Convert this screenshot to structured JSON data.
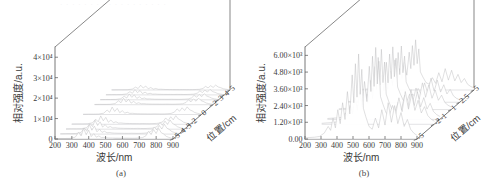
{
  "figure": {
    "width": 485,
    "height": 194,
    "background": "#ffffff",
    "line_color": "#555555",
    "trace_color": "#b9b9bd",
    "top_clipped_text": "· · · · · · · · · · · · · · · · · ·"
  },
  "panels": [
    {
      "id": "a",
      "caption": "(a)",
      "xlabel": "波长/nm",
      "ylabel": "相对强度/a.u.",
      "zlabel": "位置/cm",
      "xticks": [
        "200",
        "300",
        "400",
        "500",
        "600",
        "700",
        "800",
        "900"
      ],
      "yticks": [
        "0",
        "1×10⁴",
        "2×10⁴",
        "3×10⁴",
        "4×10⁴"
      ],
      "zticks": [
        "-5",
        "-4",
        "-3",
        "-2",
        "0",
        "2",
        "3",
        "4",
        "5"
      ]
    },
    {
      "id": "b",
      "caption": "(b)",
      "xlabel": "波长/nm",
      "ylabel": "相对强度/a.u.",
      "zlabel": "位置/cm",
      "xticks": [
        "200",
        "300",
        "400",
        "500",
        "600",
        "700",
        "800",
        "900"
      ],
      "yticks": [
        "0.00",
        "1.20×10³",
        "2.40×10³",
        "3.60×10³",
        "4.80×10³",
        "6.00×10³"
      ],
      "zticks": [
        "-5",
        "-2",
        "-1",
        "1",
        "2.5",
        "5"
      ]
    }
  ],
  "chart_data": [
    {
      "type": "line",
      "title": "(a)",
      "xlabel": "波长/nm",
      "ylabel": "相对强度/a.u.",
      "zlabel": "位置/cm",
      "projection": "3d-waterfall",
      "grid": false,
      "legend": "none",
      "xlim": [
        200,
        900
      ],
      "ylim": [
        0,
        45000
      ],
      "zlim": [
        -5,
        5
      ],
      "xticks": [
        200,
        300,
        400,
        500,
        600,
        700,
        800,
        900
      ],
      "yticks": [
        0,
        10000,
        20000,
        30000,
        40000
      ],
      "ytick_labels": [
        "0",
        "1×10⁴",
        "2×10⁴",
        "3×10⁴",
        "4×10⁴"
      ],
      "zticks": [
        -5,
        -4,
        -3,
        -2,
        0,
        2,
        3,
        4,
        5
      ],
      "ztick_labels": [
        "-5",
        "-4",
        "-3",
        "-2",
        "0",
        "2",
        "3",
        "4",
        "5"
      ],
      "x": [
        200,
        230,
        260,
        290,
        320,
        340,
        355,
        370,
        385,
        400,
        415,
        430,
        445,
        460,
        475,
        490,
        505,
        520,
        540,
        560,
        580,
        600,
        620,
        640,
        660,
        680,
        700,
        720,
        740,
        755,
        770,
        785,
        800,
        815,
        830,
        845,
        860,
        875,
        890,
        900
      ],
      "series": [
        {
          "name": "z=-5",
          "z": -5,
          "values": [
            200,
            260,
            240,
            300,
            900,
            3200,
            1500,
            5200,
            2100,
            4300,
            1200,
            2600,
            900,
            1500,
            700,
            800,
            600,
            500,
            450,
            420,
            400,
            380,
            420,
            390,
            360,
            400,
            520,
            700,
            1600,
            3800,
            2200,
            4600,
            2700,
            5200,
            3100,
            2400,
            1300,
            800,
            400,
            300
          ]
        },
        {
          "name": "z=-4",
          "z": -4,
          "values": [
            180,
            240,
            230,
            280,
            800,
            2900,
            1400,
            4700,
            1900,
            3900,
            1100,
            2400,
            850,
            1400,
            650,
            750,
            560,
            470,
            430,
            400,
            380,
            360,
            400,
            370,
            340,
            380,
            490,
            660,
            1500,
            3500,
            2000,
            4200,
            2500,
            4800,
            2900,
            2200,
            1200,
            760,
            380,
            290
          ]
        },
        {
          "name": "z=-3",
          "z": -3,
          "values": [
            170,
            230,
            215,
            265,
            760,
            2700,
            1300,
            4400,
            1800,
            3600,
            1050,
            2250,
            800,
            1300,
            620,
            700,
            530,
            450,
            410,
            385,
            365,
            345,
            385,
            355,
            325,
            365,
            470,
            630,
            1420,
            3300,
            1900,
            3950,
            2350,
            4500,
            2750,
            2100,
            1150,
            720,
            360,
            275
          ]
        },
        {
          "name": "z=-2",
          "z": -2,
          "values": [
            160,
            215,
            200,
            250,
            720,
            2500,
            1220,
            4100,
            1700,
            3400,
            990,
            2100,
            760,
            1230,
            590,
            660,
            500,
            425,
            390,
            365,
            345,
            325,
            365,
            335,
            308,
            345,
            445,
            600,
            1350,
            3100,
            1800,
            3700,
            2200,
            4200,
            2600,
            1980,
            1090,
            680,
            340,
            260
          ]
        },
        {
          "name": "z=0",
          "z": 0,
          "values": [
            140,
            190,
            180,
            225,
            640,
            2200,
            1080,
            3600,
            1500,
            3000,
            880,
            1870,
            670,
            1090,
            520,
            590,
            445,
            375,
            345,
            325,
            305,
            290,
            325,
            298,
            273,
            305,
            395,
            530,
            1200,
            2750,
            1600,
            3280,
            1950,
            3730,
            2300,
            1750,
            965,
            600,
            300,
            230
          ]
        },
        {
          "name": "z=2",
          "z": 2,
          "values": [
            120,
            165,
            155,
            195,
            560,
            1900,
            940,
            3150,
            1300,
            2600,
            760,
            1620,
            580,
            945,
            450,
            510,
            385,
            325,
            300,
            280,
            265,
            250,
            280,
            258,
            236,
            265,
            342,
            460,
            1040,
            2380,
            1385,
            2840,
            1690,
            3230,
            1990,
            1515,
            835,
            520,
            260,
            200
          ]
        },
        {
          "name": "z=3",
          "z": 3,
          "values": [
            110,
            150,
            142,
            178,
            510,
            1740,
            860,
            2880,
            1190,
            2380,
            695,
            1480,
            530,
            865,
            412,
            466,
            352,
            298,
            274,
            256,
            242,
            229,
            256,
            236,
            216,
            242,
            313,
            421,
            951,
            2177,
            1267,
            2598,
            1546,
            2955,
            1820,
            1386,
            764,
            476,
            238,
            183
          ]
        },
        {
          "name": "z=4",
          "z": 4,
          "values": [
            100,
            136,
            128,
            160,
            460,
            1570,
            775,
            2600,
            1075,
            2150,
            628,
            1337,
            479,
            781,
            372,
            421,
            318,
            269,
            248,
            231,
            219,
            207,
            231,
            213,
            195,
            219,
            283,
            380,
            859,
            1966,
            1144,
            2346,
            1396,
            2669,
            1643,
            1252,
            690,
            430,
            215,
            165
          ]
        },
        {
          "name": "z=5",
          "z": 5,
          "values": [
            90,
            122,
            115,
            144,
            414,
            1413,
            698,
            2340,
            968,
            1935,
            565,
            1203,
            431,
            703,
            335,
            379,
            286,
            242,
            223,
            208,
            197,
            186,
            208,
            192,
            176,
            197,
            255,
            342,
            773,
            1769,
            1030,
            2111,
            1256,
            2402,
            1479,
            1127,
            621,
            387,
            194,
            149
          ]
        }
      ]
    },
    {
      "type": "line",
      "title": "(b)",
      "xlabel": "波长/nm",
      "ylabel": "相对强度/a.u.",
      "zlabel": "位置/cm",
      "projection": "3d-waterfall",
      "grid": false,
      "legend": "none",
      "xlim": [
        200,
        900
      ],
      "ylim": [
        0,
        6600
      ],
      "zlim": [
        -5,
        5
      ],
      "xticks": [
        200,
        300,
        400,
        500,
        600,
        700,
        800,
        900
      ],
      "yticks": [
        0,
        1200,
        2400,
        3600,
        4800,
        6000
      ],
      "ytick_labels": [
        "0.00",
        "1.20×10³",
        "2.40×10³",
        "3.60×10³",
        "4.80×10³",
        "6.00×10³"
      ],
      "zticks": [
        -5,
        -2,
        -1,
        1,
        2.5,
        5
      ],
      "ztick_labels": [
        "-5",
        "-2",
        "-1",
        "1",
        "2.5",
        "5"
      ],
      "x": [
        200,
        230,
        260,
        290,
        320,
        345,
        360,
        375,
        390,
        405,
        420,
        435,
        450,
        465,
        480,
        495,
        505,
        515,
        525,
        535,
        545,
        555,
        565,
        580,
        600,
        620,
        640,
        660,
        680,
        700,
        720,
        740,
        760,
        780,
        800,
        820,
        840,
        860,
        880,
        900
      ],
      "series": [
        {
          "name": "z=-5",
          "z": -5,
          "values": [
            80,
            110,
            130,
            180,
            420,
            900,
            620,
            1500,
            800,
            2100,
            1100,
            2600,
            1400,
            3400,
            1800,
            4600,
            2600,
            5400,
            3000,
            6100,
            3200,
            5000,
            2200,
            1600,
            900,
            700,
            1500,
            800,
            2100,
            1000,
            2600,
            1200,
            2400,
            1100,
            1900,
            900,
            1400,
            700,
            420,
            260
          ]
        },
        {
          "name": "z=-2",
          "z": -2,
          "values": [
            72,
            100,
            118,
            163,
            380,
            815,
            560,
            1355,
            725,
            1900,
            995,
            2350,
            1265,
            3075,
            1630,
            4160,
            2350,
            4880,
            2715,
            5515,
            2895,
            4520,
            1990,
            1450,
            815,
            635,
            1355,
            725,
            1900,
            905,
            2350,
            1085,
            2170,
            995,
            1720,
            815,
            1265,
            635,
            380,
            235
          ]
        },
        {
          "name": "z=-1",
          "z": -1,
          "values": [
            66,
            91,
            107,
            148,
            346,
            741,
            510,
            1235,
            659,
            1730,
            906,
            2140,
            1153,
            2800,
            1483,
            3790,
            2140,
            4445,
            2472,
            5025,
            2636,
            4118,
            1812,
            1318,
            741,
            577,
            1235,
            659,
            1730,
            824,
            2140,
            988,
            1977,
            906,
            1565,
            741,
            1153,
            577,
            346,
            214
          ]
        },
        {
          "name": "z=1",
          "z": 1,
          "values": [
            59,
            81,
            96,
            133,
            310,
            664,
            457,
            1107,
            590,
            1550,
            812,
            1918,
            1033,
            2509,
            1328,
            3395,
            1918,
            3984,
            2214,
            4503,
            2361,
            3690,
            1623,
            1181,
            664,
            516,
            1107,
            590,
            1550,
            738,
            1918,
            886,
            1771,
            812,
            1402,
            664,
            1033,
            516,
            310,
            192
          ]
        },
        {
          "name": "z=2.5",
          "z": 2.5,
          "values": [
            53,
            73,
            86,
            119,
            278,
            595,
            410,
            992,
            529,
            1389,
            728,
            1719,
            926,
            2249,
            1190,
            3043,
            1719,
            3571,
            1984,
            4035,
            2116,
            3307,
            1455,
            1058,
            595,
            463,
            992,
            529,
            1389,
            661,
            1719,
            794,
            1587,
            728,
            1256,
            595,
            926,
            463,
            278,
            172
          ]
        },
        {
          "name": "z=5",
          "z": 5,
          "values": [
            47,
            65,
            77,
            106,
            248,
            531,
            366,
            885,
            472,
            1239,
            649,
            1534,
            826,
            2006,
            1062,
            2714,
            1534,
            3186,
            1770,
            3599,
            1888,
            2950,
            1298,
            944,
            531,
            413,
            885,
            472,
            1239,
            590,
            1534,
            708,
            1416,
            649,
            1121,
            531,
            826,
            413,
            248,
            153
          ]
        }
      ]
    }
  ]
}
